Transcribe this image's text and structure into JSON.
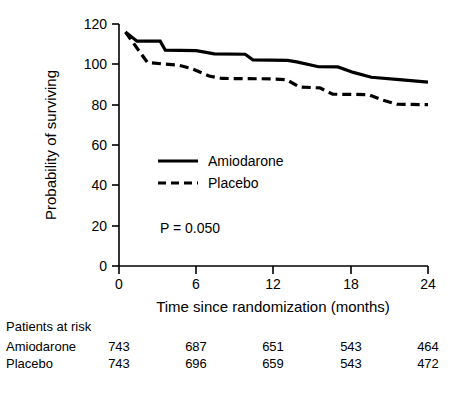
{
  "chart_data": {
    "type": "line",
    "title": "",
    "xlabel": "Time since randomization (months)",
    "ylabel": "Probability of surviving",
    "xlim": [
      0,
      24
    ],
    "ylim": [
      0,
      120
    ],
    "xticks": [
      0,
      6,
      12,
      18,
      24
    ],
    "xtick_labels": [
      "0",
      "6",
      "12",
      "18",
      "24"
    ],
    "yticks": [
      0,
      20,
      40,
      60,
      80,
      100,
      120
    ],
    "ytick_labels": [
      "0",
      "20",
      "40",
      "60",
      "80",
      "100",
      "120"
    ],
    "grid": false,
    "legend_position": "center-left",
    "annotations": [
      {
        "text": "P = 0.050",
        "x": 3.2,
        "y": 21
      }
    ],
    "series": [
      {
        "name": "Amiodarone",
        "style": "solid",
        "points": [
          [
            0.5,
            116.0
          ],
          [
            1.4,
            111.5
          ],
          [
            3.2,
            111.5
          ],
          [
            3.6,
            107.0
          ],
          [
            6.0,
            106.8
          ],
          [
            7.4,
            105.2
          ],
          [
            9.8,
            105.0
          ],
          [
            10.4,
            102.2
          ],
          [
            13.1,
            102.0
          ],
          [
            13.8,
            101.2
          ],
          [
            15.5,
            98.8
          ],
          [
            17.0,
            98.7
          ],
          [
            18.2,
            96.0
          ],
          [
            19.6,
            93.6
          ],
          [
            22.0,
            92.3
          ],
          [
            24.0,
            91.2
          ]
        ]
      },
      {
        "name": "Placebo",
        "style": "dashed",
        "points": [
          [
            0.5,
            116.0
          ],
          [
            2.2,
            101.0
          ],
          [
            3.4,
            100.2
          ],
          [
            4.6,
            99.6
          ],
          [
            5.6,
            98.0
          ],
          [
            7.0,
            94.2
          ],
          [
            8.0,
            93.0
          ],
          [
            11.8,
            92.8
          ],
          [
            13.0,
            92.4
          ],
          [
            14.0,
            88.8
          ],
          [
            15.6,
            88.3
          ],
          [
            16.6,
            85.2
          ],
          [
            19.4,
            85.0
          ],
          [
            20.4,
            82.4
          ],
          [
            21.6,
            80.2
          ],
          [
            24.0,
            80.0
          ]
        ]
      }
    ]
  },
  "legend": {
    "items": [
      {
        "label": "Amiodarone",
        "style": "solid"
      },
      {
        "label": "Placebo",
        "style": "dashed"
      }
    ]
  },
  "pvalue": {
    "text": "P = 0.050"
  },
  "risk_table": {
    "title": "Patients at risk",
    "columns": [
      "0",
      "6",
      "12",
      "18",
      "24"
    ],
    "rows": [
      {
        "label": "Amiodarone",
        "values": [
          "743",
          "687",
          "651",
          "543",
          "464"
        ]
      },
      {
        "label": "Placebo",
        "values": [
          "743",
          "696",
          "659",
          "543",
          "472"
        ]
      }
    ]
  },
  "colors": {
    "foreground": "#000000",
    "background": "#ffffff"
  }
}
